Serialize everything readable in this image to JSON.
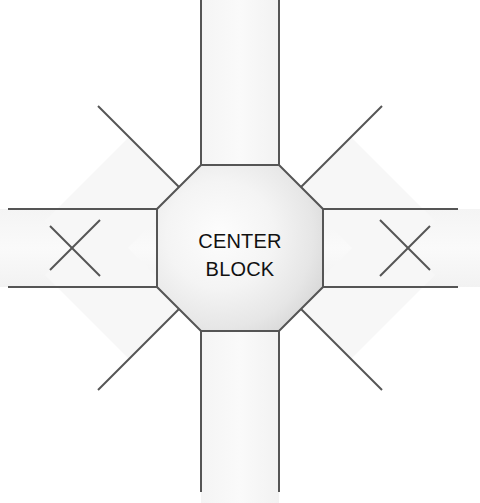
{
  "figure": {
    "center_label_line1": "CENTER",
    "center_label_line2": "BLOCK",
    "colors": {
      "background": "#ffffff",
      "arm_fill": "#f7f7f7",
      "center_fill_light": "#fbfbfb",
      "center_fill_dark": "#dcdcdc",
      "line": "#555555"
    },
    "geometry": {
      "center_x": 240,
      "center_y": 248,
      "octagon_half_width": 83,
      "octagon_flat_half": 39,
      "arm_half_width": 39,
      "line_width": 2
    },
    "arms": [
      {
        "name": "arm-north",
        "direction": "N",
        "angle_deg": 90,
        "tip_x": 240,
        "tip_y": 4
      },
      {
        "name": "arm-northeast",
        "direction": "NE",
        "angle_deg": 45,
        "tip_x": 420,
        "tip_y": 68
      },
      {
        "name": "arm-east",
        "direction": "E",
        "angle_deg": 0,
        "tip_x": 474,
        "tip_y": 248
      },
      {
        "name": "arm-southeast",
        "direction": "SE",
        "angle_deg": -45,
        "tip_x": 420,
        "tip_y": 428
      },
      {
        "name": "arm-south",
        "direction": "S",
        "angle_deg": -90,
        "tip_x": 240,
        "tip_y": 492
      },
      {
        "name": "arm-southwest",
        "direction": "SW",
        "angle_deg": -135,
        "tip_x": 60,
        "tip_y": 428
      },
      {
        "name": "arm-west",
        "direction": "W",
        "angle_deg": 180,
        "tip_x": 6,
        "tip_y": 248
      },
      {
        "name": "arm-northwest",
        "direction": "NW",
        "angle_deg": 135,
        "tip_x": 60,
        "tip_y": 68
      }
    ]
  }
}
